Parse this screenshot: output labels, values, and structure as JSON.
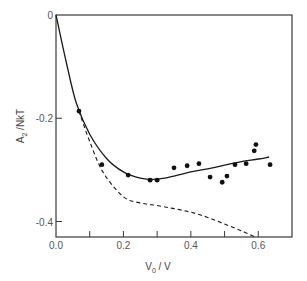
{
  "chart_data": {
    "type": "scatter",
    "title": "",
    "xlabel": "V0 / V",
    "ylabel": "A2 / NkT",
    "xlim": [
      0.0,
      0.7
    ],
    "ylim": [
      -0.43,
      0.0
    ],
    "grid": false,
    "legend": null,
    "x_ticks": [
      0.0,
      0.1,
      0.2,
      0.3,
      0.4,
      0.5,
      0.6
    ],
    "x_tick_labels": [
      "0.0",
      "",
      "0.2",
      "",
      "0.4",
      "",
      "0.6"
    ],
    "y_ticks": [
      0.0,
      -0.2,
      -0.4
    ],
    "y_tick_labels": [
      "0",
      "-0.2",
      "-0.4"
    ],
    "series": [
      {
        "name": "experimental data",
        "style": "points",
        "x": [
          0.068,
          0.136,
          0.214,
          0.279,
          0.3,
          0.35,
          0.389,
          0.424,
          0.457,
          0.493,
          0.507,
          0.531,
          0.564,
          0.588,
          0.593,
          0.635
        ],
        "y": [
          -0.186,
          -0.29,
          -0.31,
          -0.32,
          -0.32,
          -0.296,
          -0.292,
          -0.288,
          -0.314,
          -0.324,
          -0.312,
          -0.29,
          -0.288,
          -0.263,
          -0.251,
          -0.29
        ]
      },
      {
        "name": "solid curve",
        "style": "solid",
        "x": [
          0.0,
          0.03,
          0.06,
          0.1,
          0.15,
          0.2,
          0.25,
          0.3,
          0.35,
          0.4,
          0.45,
          0.5,
          0.55,
          0.6,
          0.632
        ],
        "y": [
          0.0,
          -0.09,
          -0.17,
          -0.231,
          -0.278,
          -0.304,
          -0.316,
          -0.318,
          -0.312,
          -0.304,
          -0.298,
          -0.291,
          -0.284,
          -0.279,
          -0.275
        ]
      },
      {
        "name": "dashed curve",
        "style": "dashed",
        "x": [
          0.068,
          0.1,
          0.14,
          0.2,
          0.25,
          0.3,
          0.35,
          0.4,
          0.45,
          0.5,
          0.55,
          0.59
        ],
        "y": [
          -0.186,
          -0.245,
          -0.305,
          -0.352,
          -0.364,
          -0.369,
          -0.375,
          -0.382,
          -0.392,
          -0.405,
          -0.418,
          -0.43
        ]
      }
    ]
  },
  "axes": {
    "x_label_main": "V",
    "x_label_sub": "0",
    "x_label_rest": " / V",
    "y_label_main": "A",
    "y_label_sub": "2",
    "y_label_rest": " /NkT"
  }
}
